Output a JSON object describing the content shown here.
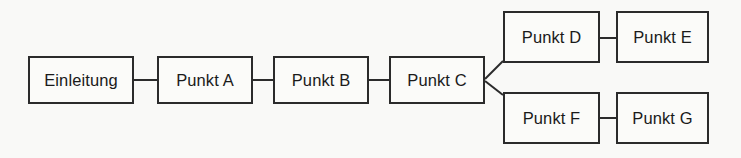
{
  "diagram": {
    "type": "flow-chain-tree",
    "background_color": "#f9f9f7",
    "box_fill_color": "#fbfbf9",
    "line_color": "#2b2b2b",
    "text_color": "#1a1a1a",
    "nodes": [
      {
        "id": "einleitung",
        "label": "Einleitung",
        "x": 28,
        "y": 56,
        "w": 106,
        "h": 48
      },
      {
        "id": "punkt-a",
        "label": "Punkt A",
        "x": 157,
        "y": 56,
        "w": 96,
        "h": 48
      },
      {
        "id": "punkt-b",
        "label": "Punkt B",
        "x": 273,
        "y": 56,
        "w": 96,
        "h": 48
      },
      {
        "id": "punkt-c",
        "label": "Punkt C",
        "x": 389,
        "y": 56,
        "w": 96,
        "h": 48
      },
      {
        "id": "punkt-d",
        "label": "Punkt D",
        "x": 503,
        "y": 11,
        "w": 97,
        "h": 52
      },
      {
        "id": "punkt-e",
        "label": "Punkt E",
        "x": 616,
        "y": 11,
        "w": 93,
        "h": 52
      },
      {
        "id": "punkt-f",
        "label": "Punkt F",
        "x": 503,
        "y": 92,
        "w": 97,
        "h": 52
      },
      {
        "id": "punkt-g",
        "label": "Punkt G",
        "x": 616,
        "y": 92,
        "w": 93,
        "h": 52
      }
    ],
    "connectors": [
      {
        "id": "einleitung-to-punkt-a",
        "from": "einleitung",
        "to": "punkt-a",
        "kind": "straight",
        "x1": 134,
        "y1": 80,
        "x2": 157,
        "y2": 80
      },
      {
        "id": "punkt-a-to-punkt-b",
        "from": "punkt-a",
        "to": "punkt-b",
        "kind": "straight",
        "x1": 253,
        "y1": 80,
        "x2": 273,
        "y2": 80
      },
      {
        "id": "punkt-b-to-punkt-c",
        "from": "punkt-b",
        "to": "punkt-c",
        "kind": "straight",
        "x1": 369,
        "y1": 80,
        "x2": 389,
        "y2": 80
      },
      {
        "id": "punkt-c-to-punkt-d",
        "from": "punkt-c",
        "to": "punkt-d",
        "kind": "diagonal",
        "x1": 485,
        "y1": 79,
        "x2": 503,
        "y2": 61
      },
      {
        "id": "punkt-c-to-punkt-f",
        "from": "punkt-c",
        "to": "punkt-f",
        "kind": "diagonal",
        "x1": 485,
        "y1": 81,
        "x2": 503,
        "y2": 95
      },
      {
        "id": "punkt-d-to-punkt-e",
        "from": "punkt-d",
        "to": "punkt-e",
        "kind": "straight",
        "x1": 600,
        "y1": 38,
        "x2": 616,
        "y2": 38
      },
      {
        "id": "punkt-f-to-punkt-g",
        "from": "punkt-f",
        "to": "punkt-g",
        "kind": "straight",
        "x1": 600,
        "y1": 118,
        "x2": 616,
        "y2": 118
      }
    ]
  }
}
